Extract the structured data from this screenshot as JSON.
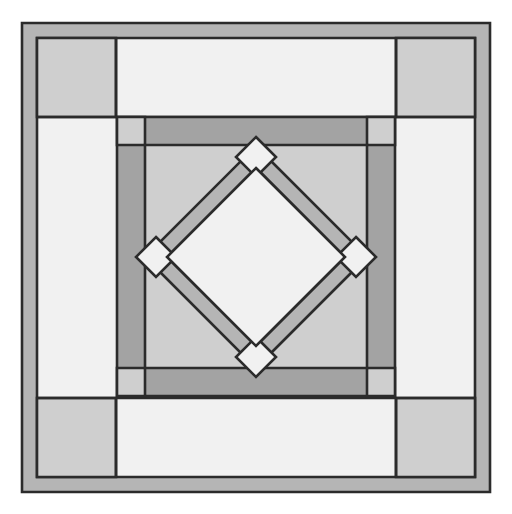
{
  "artwork": {
    "title": "Quilt Block Pattern",
    "description": "Symmetric square quilt block with nested borders and a central rotated diamond",
    "canvas": {
      "width": 512,
      "height": 514,
      "background": "#ffffff"
    }
  },
  "palette": {
    "offwhite": "#f1f1f1",
    "light_gray": "#cfcfcf",
    "medium_gray": "#b5b5b5",
    "dark_gray": "#a3a3a3",
    "outline": "#2b2b2b",
    "background": "#ffffff"
  },
  "geometry": {
    "outer_frame": {
      "x": 22,
      "y": 23,
      "width": 468,
      "height": 469,
      "band": 15
    },
    "field": {
      "x": 37,
      "y": 38,
      "width": 438,
      "height": 439
    },
    "corner_square_size": 79,
    "inner_block": {
      "x": 117,
      "y": 117,
      "width": 278,
      "height": 279,
      "band": 28
    },
    "inner_field": {
      "x": 145,
      "y": 145,
      "width": 222,
      "height": 223
    },
    "diamond": {
      "cx": 256,
      "cy": 257,
      "outer_radius": 111,
      "band": 22,
      "corner_square": 20
    }
  },
  "layers": [
    {
      "name": "outer-frame-band",
      "fill": "medium_gray",
      "role": "outermost border band"
    },
    {
      "name": "field-background",
      "fill": "offwhite",
      "role": "open field between borders"
    },
    {
      "name": "field-corner-squares",
      "fill": "light_gray",
      "count": 4,
      "role": "cornerstone squares of outer field"
    },
    {
      "name": "inner-block-band",
      "fill": "dark_gray",
      "role": "sashing ring around center block"
    },
    {
      "name": "inner-block-corner-squares",
      "fill": "light_gray",
      "count": 4,
      "role": "cornerstones of inner sashing"
    },
    {
      "name": "inner-field",
      "fill": "light_gray",
      "role": "center background panel"
    },
    {
      "name": "diamond-band",
      "fill": "medium_gray",
      "role": "rotated square ring"
    },
    {
      "name": "diamond-corner-squares",
      "fill": "offwhite",
      "count": 4,
      "role": "on-point cornerstones"
    },
    {
      "name": "diamond-center",
      "fill": "offwhite",
      "role": "center on-point square"
    }
  ]
}
